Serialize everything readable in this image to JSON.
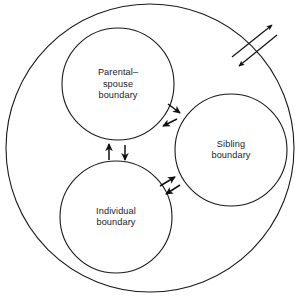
{
  "diagram": {
    "type": "venn-style nested circles with bidirectional flow arrows",
    "outer_system": {
      "name": "family-system-boundary",
      "label": "",
      "cx": 150,
      "cy": 148,
      "r": 144
    },
    "subsystems": [
      {
        "id": "parental-spouse",
        "lines": [
          "Parental–",
          "spouse",
          "boundary"
        ],
        "line1": "Parental–",
        "line2": "spouse",
        "line3": "boundary",
        "cx": 118,
        "cy": 84,
        "r": 56
      },
      {
        "id": "sibling",
        "lines": [
          "Sibling",
          "boundary"
        ],
        "line1": "Sibling",
        "line2": "boundary",
        "cx": 231,
        "cy": 150,
        "r": 56
      },
      {
        "id": "individual",
        "lines": [
          "Individual",
          "boundary"
        ],
        "line1": "Individual",
        "line2": "boundary",
        "cx": 116,
        "cy": 217,
        "r": 56
      }
    ],
    "arrow_groups": [
      {
        "id": "external-exchange",
        "description": "crossing bidirectional arrows across outer family boundary, top right",
        "direction": "outward-and-inward"
      },
      {
        "id": "parental-sibling-exchange",
        "description": "bidirectional arrows between parental-spouse and sibling subsystems",
        "direction": "two-way"
      },
      {
        "id": "parental-individual-exchange",
        "description": "bidirectional vertical arrows between parental-spouse and individual subsystems",
        "direction": "two-way"
      },
      {
        "id": "individual-sibling-exchange",
        "description": "bidirectional arrows between individual and sibling subsystems",
        "direction": "two-way"
      }
    ],
    "colors": {
      "stroke": "#1a1a1a",
      "text": "#1c1c1c",
      "background": "#ffffff",
      "arrow": "#111111"
    }
  }
}
